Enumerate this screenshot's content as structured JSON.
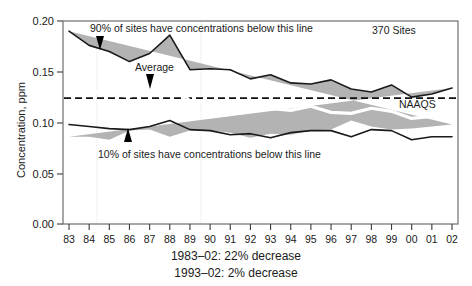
{
  "chart_data": {
    "type": "area",
    "title": "",
    "xlabel": "",
    "ylabel": "Concentration, ppm",
    "ylim": [
      0.0,
      0.2
    ],
    "yticks": [
      "0.00",
      "0.05",
      "0.10",
      "0.15",
      "0.20"
    ],
    "ytick_values": [
      0.0,
      0.05,
      0.1,
      0.15,
      0.2
    ],
    "grid": false,
    "legend_position": "none",
    "categories": [
      "83",
      "84",
      "85",
      "86",
      "87",
      "88",
      "89",
      "90",
      "91",
      "92",
      "93",
      "94",
      "95",
      "96",
      "97",
      "98",
      "99",
      "00",
      "01",
      "02"
    ],
    "x_full_years": [
      1983,
      1984,
      1985,
      1986,
      1987,
      1988,
      1989,
      1990,
      1991,
      1992,
      1993,
      1994,
      1995,
      1996,
      1997,
      1998,
      1999,
      2000,
      2001,
      2002
    ],
    "series": [
      {
        "name": "90% of sites have concentrations below this line",
        "role": "upper-envelope",
        "values": [
          0.19,
          0.176,
          0.17,
          0.16,
          0.168,
          0.186,
          0.152,
          0.153,
          0.152,
          0.143,
          0.147,
          0.139,
          0.138,
          0.142,
          0.133,
          0.13,
          0.137,
          0.125,
          0.128,
          0.134
        ]
      },
      {
        "name": "Average",
        "role": "mean",
        "values": [
          0.139,
          0.132,
          0.128,
          0.126,
          0.131,
          0.142,
          0.121,
          0.12,
          0.12,
          0.111,
          0.114,
          0.112,
          0.116,
          0.11,
          0.109,
          0.114,
          0.111,
          0.104,
          0.106,
          0.107
        ]
      },
      {
        "name": "10% of sites have concentrations below this line",
        "role": "lower-envelope",
        "values": [
          0.098,
          0.096,
          0.094,
          0.093,
          0.096,
          0.102,
          0.093,
          0.092,
          0.088,
          0.089,
          0.085,
          0.09,
          0.092,
          0.092,
          0.086,
          0.093,
          0.092,
          0.083,
          0.086,
          0.086
        ]
      }
    ],
    "reference_line": {
      "label": "NAAQS",
      "value": 0.124,
      "style": "dashed"
    },
    "annotations": [
      {
        "name": "upper-annotation",
        "text": "90% of sites have concentrations below this line",
        "points_to_year": 1985
      },
      {
        "name": "average-annotation",
        "text": "Average",
        "points_to_year": 1987
      },
      {
        "name": "lower-annotation",
        "text": "10% of sites have concentrations below this line",
        "points_to_year": 1986
      },
      {
        "name": "site-count",
        "text": "370 Sites"
      }
    ]
  },
  "axes": {
    "y_title": "Concentration, ppm",
    "y_labels": [
      "0.20",
      "0.15",
      "0.10",
      "0.05",
      "0.00"
    ],
    "x_labels": [
      "83",
      "84",
      "85",
      "86",
      "87",
      "88",
      "89",
      "90",
      "91",
      "92",
      "93",
      "94",
      "95",
      "96",
      "97",
      "98",
      "99",
      "00",
      "01",
      "02"
    ]
  },
  "labels": {
    "upper_note": "90% of sites have concentrations below this line",
    "average": "Average",
    "lower_note": "10% of sites have concentrations below this line",
    "site_count": "370 Sites",
    "naaqs": "NAAQS"
  },
  "caption": {
    "line1": "1983–02: 22% decrease",
    "line2": "1993–02:  2% decrease"
  },
  "colors": {
    "band_fill": "#b3b3b3",
    "envelope_stroke": "#1a1a1a",
    "average_stroke": "#ffffff",
    "naaqs_stroke": "#111111",
    "frame_stroke": "#6e6e6e",
    "background": "#ffffff"
  }
}
